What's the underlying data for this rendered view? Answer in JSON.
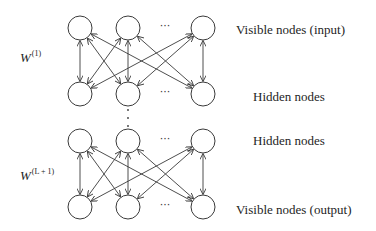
{
  "diagram": {
    "type": "stacked-rbm-network",
    "layers": [
      {
        "id": "visible-input",
        "label": "Visible nodes (input)",
        "y": 28,
        "label_x": 236,
        "label_y": 23
      },
      {
        "id": "hidden-1",
        "label": "Hidden nodes",
        "y": 94,
        "label_x": 253,
        "label_y": 90
      },
      {
        "id": "hidden-2",
        "label": "Hidden nodes",
        "y": 141,
        "label_x": 253,
        "label_y": 134
      },
      {
        "id": "visible-output",
        "label": "Visible nodes (output)",
        "y": 207,
        "label_x": 236,
        "label_y": 203
      }
    ],
    "node_columns_x": [
      80,
      128,
      203
    ],
    "node_radius": 12,
    "ellipsis": "···",
    "ellipsis_x": 165,
    "weights": [
      {
        "id": "w1",
        "base": "W",
        "superscript": "(1)",
        "x": 20,
        "y": 50,
        "between": [
          "visible-input",
          "hidden-1"
        ]
      },
      {
        "id": "wL1",
        "base": "W",
        "superscript": "(L + 1)",
        "x": 20,
        "y": 168,
        "between": [
          "hidden-2",
          "visible-output"
        ]
      }
    ],
    "vertical_dots": {
      "x": 128,
      "y": [
        110,
        118,
        126
      ]
    },
    "edge_style": "bidirectional-arrows",
    "connectivity": "fully-connected between adjacent layers"
  }
}
